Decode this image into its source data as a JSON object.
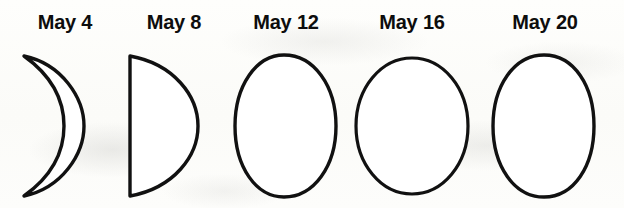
{
  "figure": {
    "type": "moon-phase-sequence",
    "title": "",
    "background_color": "#fdfdfb",
    "ink_color": "#111111",
    "month": "May",
    "phase_count": 5
  },
  "phases": [
    {
      "label": "May 4",
      "date": "May 4",
      "day": 4,
      "phase_name": "waxing crescent",
      "illuminated_side": "right",
      "shape": "crescent",
      "icon": "moon-waxing-crescent-icon"
    },
    {
      "label": "May 8",
      "date": "May 8",
      "day": 8,
      "phase_name": "first quarter",
      "illuminated_side": "right",
      "shape": "half-disc",
      "icon": "moon-first-quarter-icon"
    },
    {
      "label": "May 12",
      "date": "May 12",
      "day": 12,
      "phase_name": "waxing gibbous",
      "illuminated_side": "right",
      "shape": "gibbous",
      "icon": "moon-waxing-gibbous-icon"
    },
    {
      "label": "May 16",
      "date": "May 16",
      "day": 16,
      "phase_name": "full moon",
      "illuminated_side": "full",
      "shape": "full-disc",
      "icon": "moon-full-icon"
    },
    {
      "label": "May 20",
      "date": "May 20",
      "day": 20,
      "phase_name": "waning gibbous",
      "illuminated_side": "left",
      "shape": "gibbous",
      "icon": "moon-waning-gibbous-icon"
    }
  ]
}
